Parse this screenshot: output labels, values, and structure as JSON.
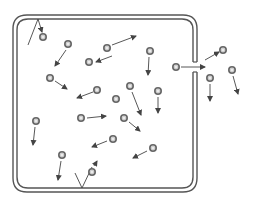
{
  "diagram": {
    "colors": {
      "wall": "#555555",
      "particle_ring": "#666666",
      "particle_fill": "#d0d0d0",
      "arrow": "#444444",
      "background": "#ffffff"
    },
    "container": {
      "outer": {
        "x": 13,
        "y": 15,
        "w": 184,
        "h": 177,
        "r": 14
      },
      "inner": {
        "x": 17,
        "y": 19,
        "w": 176,
        "h": 169,
        "r": 11
      },
      "opening": {
        "side": "right",
        "y_top": 62,
        "y_bottom": 72
      }
    },
    "particles": [
      {
        "id": "p1",
        "x": 43,
        "y": 37
      },
      {
        "id": "p2",
        "x": 68,
        "y": 44
      },
      {
        "id": "p3",
        "x": 107,
        "y": 48
      },
      {
        "id": "p4",
        "x": 89,
        "y": 62
      },
      {
        "id": "p5",
        "x": 50,
        "y": 78
      },
      {
        "id": "p6",
        "x": 97,
        "y": 90
      },
      {
        "id": "p7",
        "x": 116,
        "y": 99
      },
      {
        "id": "p8",
        "x": 150,
        "y": 51
      },
      {
        "id": "p9",
        "x": 130,
        "y": 86
      },
      {
        "id": "p10",
        "x": 158,
        "y": 91
      },
      {
        "id": "p11",
        "x": 176,
        "y": 67
      },
      {
        "id": "p12",
        "x": 223,
        "y": 50
      },
      {
        "id": "p13",
        "x": 210,
        "y": 78
      },
      {
        "id": "p14",
        "x": 232,
        "y": 70
      },
      {
        "id": "p15",
        "x": 36,
        "y": 121
      },
      {
        "id": "p16",
        "x": 81,
        "y": 118
      },
      {
        "id": "p17",
        "x": 124,
        "y": 118
      },
      {
        "id": "p18",
        "x": 113,
        "y": 139
      },
      {
        "id": "p19",
        "x": 62,
        "y": 155
      },
      {
        "id": "p20",
        "x": 153,
        "y": 148
      },
      {
        "id": "p21",
        "x": 92,
        "y": 172
      }
    ],
    "arrows": [
      {
        "id": "a1",
        "x1": 38,
        "y1": 19,
        "x2": 42,
        "y2": 32,
        "note": "rebound from top wall"
      },
      {
        "id": "a2",
        "x1": 66,
        "y1": 50,
        "x2": 55,
        "y2": 66
      },
      {
        "id": "a3",
        "x1": 112,
        "y1": 45,
        "x2": 136,
        "y2": 36
      },
      {
        "id": "a4",
        "x1": 112,
        "y1": 56,
        "x2": 96,
        "y2": 62
      },
      {
        "id": "a5",
        "x1": 55,
        "y1": 81,
        "x2": 67,
        "y2": 89
      },
      {
        "id": "a6",
        "x1": 93,
        "y1": 92,
        "x2": 77,
        "y2": 98
      },
      {
        "id": "a7",
        "x1": 149,
        "y1": 57,
        "x2": 148,
        "y2": 75
      },
      {
        "id": "a8",
        "x1": 132,
        "y1": 92,
        "x2": 141,
        "y2": 115
      },
      {
        "id": "a9",
        "x1": 158,
        "y1": 97,
        "x2": 158,
        "y2": 113
      },
      {
        "id": "a10",
        "x1": 181,
        "y1": 67,
        "x2": 205,
        "y2": 67,
        "note": "escaping through opening"
      },
      {
        "id": "a11",
        "x1": 205,
        "y1": 60,
        "x2": 219,
        "y2": 52
      },
      {
        "id": "a12",
        "x1": 210,
        "y1": 84,
        "x2": 210,
        "y2": 101
      },
      {
        "id": "a13",
        "x1": 233,
        "y1": 76,
        "x2": 238,
        "y2": 94
      },
      {
        "id": "a14",
        "x1": 35,
        "y1": 127,
        "x2": 33,
        "y2": 145
      },
      {
        "id": "a15",
        "x1": 87,
        "y1": 118,
        "x2": 106,
        "y2": 116
      },
      {
        "id": "a16",
        "x1": 129,
        "y1": 122,
        "x2": 140,
        "y2": 131
      },
      {
        "id": "a17",
        "x1": 107,
        "y1": 141,
        "x2": 92,
        "y2": 147
      },
      {
        "id": "a18",
        "x1": 61,
        "y1": 161,
        "x2": 58,
        "y2": 180
      },
      {
        "id": "a19",
        "x1": 147,
        "y1": 151,
        "x2": 133,
        "y2": 158
      },
      {
        "id": "a20",
        "x1": 94,
        "y1": 166,
        "x2": 97,
        "y2": 161,
        "note": "rebound from bottom wall"
      }
    ],
    "incident_paths": [
      {
        "id": "i1",
        "x1": 28,
        "y1": 45,
        "x2": 38,
        "y2": 19
      },
      {
        "id": "i2",
        "x1": 75,
        "y1": 173,
        "x2": 82,
        "y2": 188
      },
      {
        "id": "i3",
        "x1": 82,
        "y1": 188,
        "x2": 92,
        "y2": 167
      }
    ]
  }
}
